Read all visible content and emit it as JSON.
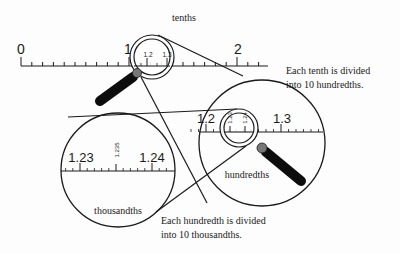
{
  "diagram": {
    "title_label": "tenths",
    "main_ruler": {
      "labels": [
        "0",
        "1",
        "2"
      ],
      "magnified_labels": [
        "1.2",
        "1.3"
      ]
    },
    "hundredths_view": {
      "label": "hundredths",
      "labels": [
        "1.2",
        "1.3"
      ],
      "magnified_labels": [
        "1.23",
        "1.24"
      ],
      "caption_line1": "Each tenth is divided",
      "caption_line2": "into 10 hundredths."
    },
    "thousandths_view": {
      "label": "thousandths",
      "labels": [
        "1.23",
        "1.24"
      ],
      "mid_label": "1.235",
      "caption_line1": "Each hundredth is divided",
      "caption_line2": "into 10 thousandths."
    },
    "colors": {
      "line": "#1a1a1a",
      "handle": "#0d0d0d",
      "handle_joint": "#777777",
      "background": "#fdfdfd"
    }
  }
}
